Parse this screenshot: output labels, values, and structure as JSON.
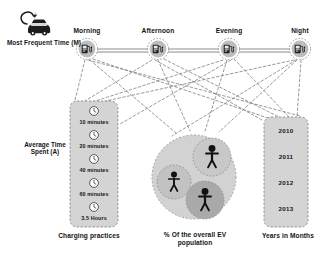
{
  "diagram": {
    "title_present": false,
    "legend": {
      "car_icon": "electric-car-charging-icon",
      "car_label": "Most Frequent Time (M)",
      "avg_label": "Average Time Spent (A)"
    },
    "top_nodes": [
      {
        "label": "Morning",
        "icon": "charging-station-icon",
        "x": 87,
        "y": 49
      },
      {
        "label": "Afternoon",
        "icon": "charging-station-icon",
        "x": 158,
        "y": 49
      },
      {
        "label": "Evening",
        "icon": "charging-station-icon",
        "x": 229,
        "y": 49
      },
      {
        "label": "Night",
        "icon": "charging-station-icon",
        "x": 300,
        "y": 49
      }
    ],
    "charging_practices": {
      "caption": "Charging practices",
      "items": [
        {
          "label": "10 minutes",
          "icon": "clock-icon"
        },
        {
          "label": "20 minutes",
          "icon": "clock-icon"
        },
        {
          "label": "40 minutes",
          "icon": "clock-icon"
        },
        {
          "label": "60 minutes",
          "icon": "clock-icon"
        },
        {
          "label": "3.5 Hours",
          "icon": "clock-icon"
        }
      ]
    },
    "population": {
      "caption": "% Of the overall EV population",
      "groups": [
        {
          "icon": "person-icon",
          "cx": 174,
          "cy": 182,
          "r": 17
        },
        {
          "icon": "person-icon",
          "cx": 212,
          "cy": 157,
          "r": 19
        },
        {
          "icon": "person-icon",
          "cx": 205,
          "cy": 200,
          "r": 19
        }
      ]
    },
    "years": {
      "caption": "Years in Months",
      "items": [
        "2010",
        "2011",
        "2012",
        "2013"
      ]
    },
    "colors": {
      "panel_fill": "#d4d4d4",
      "panel_stroke": "#8a8a8a",
      "node_fill": "#bdbdbd",
      "icon_dark": "#1c1c1c",
      "line": "#6f6f6f",
      "big_circle": "#d2d2d2",
      "inner_circle_light": "#c2c2c2",
      "inner_circle_dark": "#a9a9a9",
      "text": "#141414",
      "background": "#ffffff"
    }
  }
}
